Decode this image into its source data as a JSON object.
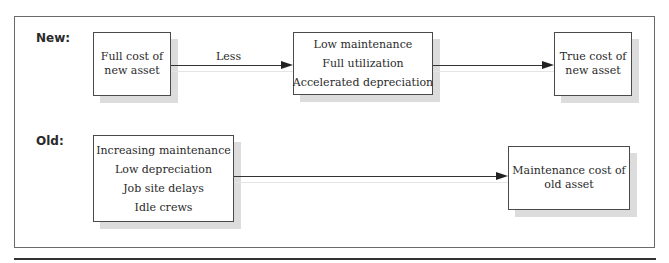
{
  "rows": {
    "new": {
      "label": "New:",
      "source_box": {
        "lines": [
          "Full cost of",
          "new asset"
        ]
      },
      "arrow1_label": "Less",
      "middle_box": {
        "lines": [
          "Low maintenance",
          "Full utilization",
          "Accelerated depreciation"
        ]
      },
      "result_box": {
        "lines": [
          "True cost of",
          "new asset"
        ]
      }
    },
    "old": {
      "label": "Old:",
      "source_box": {
        "lines": [
          "Increasing maintenance",
          "Low depreciation",
          "Job site delays",
          "Idle crews"
        ]
      },
      "result_box": {
        "lines": [
          "Maintenance cost of",
          "old asset"
        ]
      }
    }
  },
  "colors": {
    "border": "#4a4a4a",
    "shadow": "#dcdcdc",
    "text": "#2a2a2a"
  }
}
